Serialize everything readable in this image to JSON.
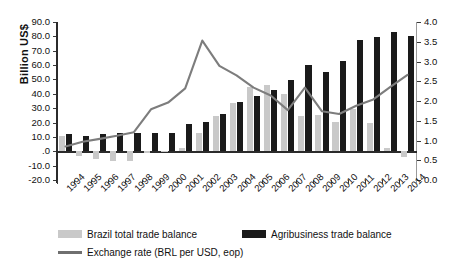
{
  "chart_data": {
    "type": "bar",
    "title": "",
    "subtitle": "",
    "xlabel": "",
    "ylabel": "Billion US$",
    "y2label": "",
    "categories": [
      "1994",
      "1995",
      "1996",
      "1997",
      "1998",
      "1999",
      "2000",
      "2001",
      "2002",
      "2003",
      "2004",
      "2005",
      "2006",
      "2007",
      "2008",
      "2009",
      "2010",
      "2011",
      "2012",
      "2013",
      "2014"
    ],
    "ylim": [
      -20.0,
      90.0
    ],
    "ytick_step": 10.0,
    "yticks": [
      "90.0",
      "80.0",
      "70.0",
      "60.0",
      "50.0",
      "40.0",
      "30.0",
      "20.0",
      "10.0",
      ".0",
      "-10.0",
      "-20.0"
    ],
    "y2lim": [
      0.0,
      4.0
    ],
    "y2tick_step": 0.5,
    "y2ticks": [
      "4.0",
      "3.5",
      "3.0",
      "2.5",
      "2.0",
      "1.5",
      "1.0",
      "0.5",
      "0.0"
    ],
    "grid": false,
    "legend_position": "bottom",
    "series": [
      {
        "name": "Brazil total trade balance",
        "type": "bar",
        "axis": "left",
        "color": "#c9c9c9",
        "values": [
          10.4,
          -3.5,
          -5.6,
          -6.8,
          -6.6,
          -1.3,
          -0.7,
          2.6,
          13.1,
          24.8,
          33.6,
          44.7,
          46.5,
          40.0,
          24.8,
          25.3,
          20.1,
          29.8,
          19.4,
          2.4,
          -4.0
        ]
      },
      {
        "name": "Agribusiness trade balance",
        "type": "bar",
        "axis": "left",
        "color": "#1a1a1a",
        "values": [
          11.8,
          10.4,
          12.0,
          13.0,
          12.5,
          13.0,
          13.0,
          19.0,
          20.3,
          25.8,
          34.1,
          38.4,
          42.6,
          49.7,
          60.0,
          54.9,
          63.0,
          77.5,
          79.4,
          82.9,
          80.1
        ]
      },
      {
        "name": "Exchange rate (BRL per USD, eop)",
        "type": "line",
        "axis": "right",
        "color": "#7d7d7d",
        "values": [
          0.85,
          0.97,
          1.04,
          1.12,
          1.21,
          1.79,
          1.96,
          2.32,
          3.53,
          2.89,
          2.65,
          2.34,
          2.14,
          1.77,
          2.34,
          1.74,
          1.67,
          1.88,
          2.04,
          2.36,
          2.66
        ]
      }
    ],
    "legend_entries": [
      {
        "label": "Brazil total trade balance",
        "swatch": "bar",
        "color": "#c9c9c9"
      },
      {
        "label": "Agribusiness trade balance",
        "swatch": "bar",
        "color": "#1a1a1a"
      },
      {
        "label": "Exchange rate (BRL per USD, eop)",
        "swatch": "line",
        "color": "#6f6f6f"
      }
    ]
  }
}
